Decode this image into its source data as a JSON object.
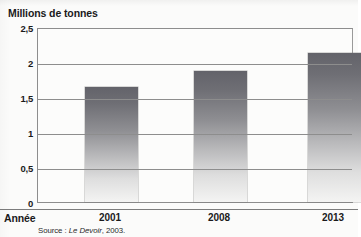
{
  "chart_data": {
    "type": "bar",
    "title": "",
    "ylabel": "Millions de tonnes",
    "xlabel": "Année",
    "categories": [
      "2001",
      "2008",
      "2013"
    ],
    "values": [
      1.65,
      1.87,
      2.13
    ],
    "ylim": [
      0,
      2.5
    ],
    "yticks": [
      0,
      0.5,
      1,
      1.5,
      2,
      2.5
    ],
    "ytick_labels": [
      "0",
      "0,5",
      "1",
      "1,5",
      "2",
      "2,5"
    ],
    "grid": true,
    "legend": "none",
    "series": [
      {
        "name": "Millions de tonnes",
        "values": [
          1.65,
          1.87,
          2.13
        ]
      }
    ],
    "bar_fill": "vertical gradient dark-gray to white",
    "colors": {
      "bar_top": "#63636a",
      "bar_bottom": "#f4f4f3",
      "gridline": "#8d8d8d",
      "text": "#1a1a1a",
      "background": "#fbfbfa"
    }
  },
  "source": {
    "prefix": "Source :",
    "publication": "Le Devoir",
    "suffix": ", 2003."
  }
}
